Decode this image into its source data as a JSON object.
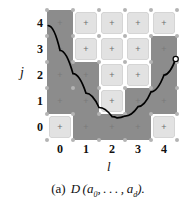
{
  "figure": {
    "caption_tag": "(a)",
    "caption_symbol": "D",
    "caption_args": "(a0,…,ad).",
    "caption_full": "(a) D(a0,…,ad)."
  },
  "chart_data": {
    "type": "heatmap",
    "title": "",
    "xlabel": "l",
    "ylabel": "j",
    "xlim": [
      -0.5,
      4.5
    ],
    "ylim": [
      -0.5,
      4.5
    ],
    "xticks": [
      "0",
      "1",
      "2",
      "3",
      "4"
    ],
    "yticks": [
      "4",
      "3",
      "2",
      "1",
      "0"
    ],
    "grid": true,
    "legend": "none",
    "cell_marker": "+",
    "colors": {
      "light_cell": "#e2e2e2",
      "dark_cell": "#8c8c8c",
      "node": "#b4b4b4",
      "curve": "#000000",
      "marker_plus": "#6e6e6e",
      "text": "#111111",
      "background": "#ffffff"
    },
    "categories_x": [
      0,
      1,
      2,
      3,
      4
    ],
    "categories_y": [
      0,
      1,
      2,
      3,
      4
    ],
    "cell_states": [
      {
        "j": 4,
        "row": [
          "dark",
          "light",
          "light",
          "light",
          "light"
        ]
      },
      {
        "j": 3,
        "row": [
          "dark",
          "light",
          "light",
          "light",
          "dark"
        ]
      },
      {
        "j": 2,
        "row": [
          "dark",
          "dark",
          "light",
          "light",
          "dark"
        ]
      },
      {
        "j": 1,
        "row": [
          "dark",
          "dark",
          "light",
          "dark",
          "dark"
        ]
      },
      {
        "j": 0,
        "row": [
          "light",
          "dark",
          "dark",
          "dark",
          "light"
        ]
      }
    ],
    "light_cells": [
      {
        "l": 1,
        "j": 4
      },
      {
        "l": 2,
        "j": 4
      },
      {
        "l": 3,
        "j": 4
      },
      {
        "l": 4,
        "j": 4
      },
      {
        "l": 1,
        "j": 3
      },
      {
        "l": 2,
        "j": 3
      },
      {
        "l": 3,
        "j": 3
      },
      {
        "l": 2,
        "j": 2
      },
      {
        "l": 3,
        "j": 2
      },
      {
        "l": 2,
        "j": 1
      },
      {
        "l": 0,
        "j": 0
      },
      {
        "l": 4,
        "j": 0
      }
    ],
    "curve": {
      "name": "parabola",
      "shape": "parabola",
      "color": "#000000",
      "vertex": [
        2.2,
        0.35
      ],
      "points": [
        [
          -0.45,
          3.9
        ],
        [
          0.0,
          2.95
        ],
        [
          0.5,
          2.05
        ],
        [
          1.0,
          1.3
        ],
        [
          1.5,
          0.75
        ],
        [
          2.0,
          0.4
        ],
        [
          2.2,
          0.35
        ],
        [
          2.5,
          0.42
        ],
        [
          3.0,
          0.78
        ],
        [
          3.5,
          1.35
        ],
        [
          4.0,
          2.0
        ],
        [
          4.45,
          2.62
        ]
      ],
      "endpoint_marker": {
        "l": 4.45,
        "j": 2.62,
        "style": "open-circle"
      }
    }
  }
}
